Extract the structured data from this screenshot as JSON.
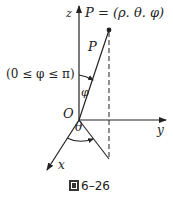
{
  "diagram": {
    "type": "spherical-coordinates",
    "labels": {
      "z_axis": "z",
      "y_axis": "y",
      "x_axis": "x",
      "origin": "O",
      "point_eq": "P = (ρ. θ. φ)",
      "segment": "P",
      "phi": "φ",
      "theta": "θ",
      "phi_range": "(0 ≤ φ ≤ π)"
    },
    "caption": {
      "icon": "figure-char-icon",
      "text": "6–26"
    },
    "colors": {
      "stroke": "#222222",
      "background": "#ffffff"
    }
  }
}
